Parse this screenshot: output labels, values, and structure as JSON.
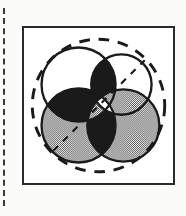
{
  "page": {
    "background_color": "#fbfbfa",
    "width": 186,
    "height": 216
  },
  "margin_rule": {
    "name": "left-margin-dashed-rule",
    "orientation": "vertical",
    "color": "#3a3a3a",
    "style": "dashed"
  },
  "figure": {
    "frame": {
      "border_color": "#2b2b2b",
      "fill_color": "#ffffff",
      "border_width": 2
    },
    "caption": "",
    "diagram_type": "four-circle Venn diagram with dashed enclosing circle"
  },
  "chart_data": {
    "type": "venn",
    "title": "",
    "subtitle": "",
    "xlabel": "",
    "ylabel": "",
    "legend_position": "none",
    "grid": false,
    "colors": {
      "outline": "#1a1a1a",
      "fill_white": "#ffffff",
      "fill_gray": "#9a9a9a",
      "fill_black": "#1a1a1a",
      "dashed_stroke": "#1a1a1a",
      "frame": "#2b2b2b"
    },
    "enclosing_circle": {
      "name": "universal-set-boundary",
      "style": "dashed",
      "cx": 76.5,
      "cy": 79.5,
      "r": 68
    },
    "diagonals": [
      {
        "name": "dashed-diagonal-major",
        "style": "dashed",
        "x1": 30,
        "y1": 126,
        "x2": 124,
        "y2": 33
      }
    ],
    "sets": [
      {
        "name": "set-top-left",
        "label": "",
        "cx": 56,
        "cy": 58,
        "r": 38,
        "fill": "#ffffff"
      },
      {
        "name": "set-top-right",
        "label": "",
        "cx": 100,
        "cy": 58,
        "r": 31,
        "fill": "#ffffff"
      },
      {
        "name": "set-bottom-left",
        "label": "",
        "cx": 56,
        "cy": 100,
        "r": 38,
        "fill": "#9a9a9a"
      },
      {
        "name": "set-bottom-right",
        "label": "",
        "cx": 102,
        "cy": 100,
        "r": 37,
        "fill": "#9a9a9a"
      }
    ],
    "regions": [
      {
        "name": "region-top-left-only",
        "shade": "white",
        "value": ""
      },
      {
        "name": "region-top-right-only",
        "shade": "white",
        "value": ""
      },
      {
        "name": "region-bottom-left-only",
        "shade": "gray",
        "value": ""
      },
      {
        "name": "region-bottom-right-only",
        "shade": "gray",
        "value": ""
      },
      {
        "name": "region-top-intersection",
        "shade": "black",
        "value": ""
      },
      {
        "name": "region-left-intersection",
        "shade": "black",
        "value": ""
      },
      {
        "name": "region-bottom-intersection",
        "shade": "black",
        "value": ""
      },
      {
        "name": "region-right-intersection",
        "shade": "gray",
        "value": ""
      },
      {
        "name": "region-center",
        "shade": "white",
        "value": ""
      }
    ]
  }
}
